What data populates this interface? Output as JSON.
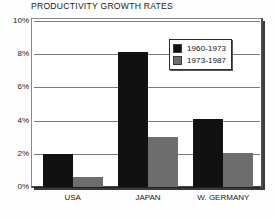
{
  "chart_data": {
    "type": "bar",
    "title": "PRODUCTIVITY GROWTH RATES",
    "xlabel": "",
    "ylabel": "",
    "categories": [
      "USA",
      "JAPAN",
      "W. GERMANY"
    ],
    "series": [
      {
        "name": "1960-1973",
        "color": "#111111",
        "values": [
          2.0,
          8.15,
          4.1
        ]
      },
      {
        "name": "1973-1987",
        "color": "#6d6d6d",
        "values": [
          0.6,
          3.0,
          2.05
        ]
      }
    ],
    "ylim": [
      0,
      10
    ],
    "ytick_values": [
      10,
      8,
      6,
      4,
      2,
      0
    ],
    "ytick_labels": [
      "10%",
      "8%",
      "6%",
      "4%",
      "2%",
      "0%"
    ],
    "grid": true,
    "grid_axis": "y",
    "legend_position": "upper right",
    "annotations": []
  },
  "colors": {
    "series_1960_1973": "#111111",
    "series_1973_1987": "#6d6d6d",
    "gridline": "#7a7a7a",
    "axis": "#1f1f1f",
    "text": "#1a1a1a",
    "plot_background": "#ffffff",
    "page_background": "#fdfdfd"
  }
}
